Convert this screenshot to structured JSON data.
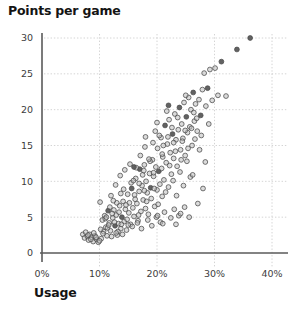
{
  "chart_data": {
    "type": "scatter",
    "title": "Points per game",
    "xlabel": "Usage",
    "ylabel": "Points per game",
    "xtick_labels": [
      "0%",
      "10%",
      "20%",
      "30%",
      "40%"
    ],
    "xtick_values": [
      0,
      10,
      20,
      30,
      40
    ],
    "ytick_labels": [
      "0",
      "5",
      "10",
      "15",
      "20",
      "25",
      "30"
    ],
    "ytick_values": [
      0,
      5,
      10,
      15,
      20,
      25,
      30
    ],
    "xlim": [
      0,
      42
    ],
    "ylim": [
      0,
      31.5
    ],
    "grid": true,
    "legend": false,
    "marker": {
      "shape": "circle",
      "radius_px": 2.4,
      "fill": "#bdbdbd",
      "stroke": "#4a4a4a",
      "fill_dark": "#5a5a5a",
      "fill_light": "#e3e3e3"
    },
    "axis_color": "#5a5a5a",
    "grid_color": "#c9c9c9",
    "series": [
      {
        "name": "players",
        "points": [
          [
            7.1,
            2.6,
            0
          ],
          [
            7.4,
            2.1,
            0
          ],
          [
            7.6,
            2.9,
            0
          ],
          [
            7.9,
            2.3,
            0
          ],
          [
            8.1,
            1.8,
            0
          ],
          [
            8.3,
            2.6,
            0
          ],
          [
            8.6,
            2.2,
            0
          ],
          [
            8.9,
            1.6,
            0
          ],
          [
            9.2,
            2.4,
            0
          ],
          [
            9.5,
            1.9,
            0
          ],
          [
            9.8,
            1.5,
            0
          ],
          [
            10.1,
            7.1,
            0
          ],
          [
            10.3,
            2.0,
            0
          ],
          [
            10.5,
            4.6,
            0
          ],
          [
            10.7,
            3.0,
            0
          ],
          [
            10.9,
            5.2,
            0
          ],
          [
            11.1,
            3.6,
            0
          ],
          [
            11.3,
            2.4,
            0
          ],
          [
            11.5,
            5.9,
            1
          ],
          [
            11.7,
            4.2,
            0
          ],
          [
            11.9,
            3.1,
            0
          ],
          [
            12.1,
            2.3,
            0
          ],
          [
            12.3,
            4.9,
            0
          ],
          [
            12.5,
            6.0,
            0
          ],
          [
            12.7,
            3.8,
            1
          ],
          [
            12.9,
            5.3,
            0
          ],
          [
            13.1,
            2.5,
            0
          ],
          [
            13.3,
            4.1,
            0
          ],
          [
            13.5,
            6.6,
            0
          ],
          [
            13.7,
            3.4,
            0
          ],
          [
            13.9,
            5.0,
            1
          ],
          [
            14.1,
            7.2,
            0
          ],
          [
            14.3,
            4.4,
            0
          ],
          [
            14.5,
            6.1,
            0
          ],
          [
            14.7,
            3.2,
            0
          ],
          [
            14.9,
            8.2,
            0
          ],
          [
            15.1,
            5.6,
            0
          ],
          [
            15.2,
            7.0,
            0
          ],
          [
            15.4,
            4.0,
            0
          ],
          [
            15.6,
            9.0,
            1
          ],
          [
            15.8,
            6.3,
            0
          ],
          [
            16.0,
            5.1,
            0
          ],
          [
            16.1,
            8.1,
            0
          ],
          [
            16.3,
            10.4,
            0
          ],
          [
            16.5,
            6.9,
            0
          ],
          [
            16.7,
            4.5,
            0
          ],
          [
            16.9,
            8.6,
            0
          ],
          [
            17.0,
            11.7,
            1
          ],
          [
            17.2,
            5.8,
            0
          ],
          [
            17.4,
            9.4,
            0
          ],
          [
            17.6,
            7.4,
            0
          ],
          [
            17.8,
            12.3,
            0
          ],
          [
            18.0,
            6.2,
            0
          ],
          [
            18.1,
            10.0,
            0
          ],
          [
            18.3,
            8.4,
            0
          ],
          [
            18.5,
            5.4,
            0
          ],
          [
            18.7,
            11.1,
            0
          ],
          [
            18.9,
            9.1,
            1
          ],
          [
            19.0,
            7.6,
            0
          ],
          [
            19.2,
            13.0,
            0
          ],
          [
            19.4,
            10.7,
            0
          ],
          [
            19.6,
            6.5,
            0
          ],
          [
            19.8,
            12.0,
            0
          ],
          [
            20.0,
            8.8,
            0
          ],
          [
            20.1,
            14.6,
            0
          ],
          [
            20.3,
            11.4,
            1
          ],
          [
            20.5,
            9.6,
            0
          ],
          [
            20.7,
            16.1,
            0
          ],
          [
            20.9,
            7.9,
            0
          ],
          [
            21.0,
            13.4,
            0
          ],
          [
            21.2,
            10.2,
            0
          ],
          [
            21.4,
            17.8,
            1
          ],
          [
            21.6,
            12.6,
            0
          ],
          [
            21.8,
            15.2,
            0
          ],
          [
            22.0,
            9.2,
            0
          ],
          [
            22.1,
            18.6,
            0
          ],
          [
            22.3,
            14.0,
            0
          ],
          [
            22.5,
            11.0,
            0
          ],
          [
            22.7,
            16.6,
            1
          ],
          [
            22.9,
            13.2,
            0
          ],
          [
            23.1,
            19.4,
            0
          ],
          [
            23.3,
            15.8,
            0
          ],
          [
            23.5,
            12.1,
            0
          ],
          [
            23.7,
            17.2,
            0
          ],
          [
            23.9,
            20.3,
            1
          ],
          [
            24.1,
            14.4,
            0
          ],
          [
            24.3,
            18.0,
            0
          ],
          [
            24.5,
            16.0,
            0
          ],
          [
            24.7,
            21.0,
            0
          ],
          [
            24.9,
            13.6,
            0
          ],
          [
            25.1,
            19.0,
            1
          ],
          [
            25.3,
            16.8,
            0
          ],
          [
            25.5,
            21.7,
            0
          ],
          [
            25.7,
            17.6,
            0
          ],
          [
            25.9,
            20.0,
            0
          ],
          [
            26.1,
            15.0,
            0
          ],
          [
            26.3,
            22.4,
            1
          ],
          [
            26.5,
            18.4,
            0
          ],
          [
            26.7,
            20.8,
            0
          ],
          [
            27.0,
            17.0,
            0
          ],
          [
            27.3,
            21.4,
            0
          ],
          [
            27.6,
            19.2,
            1
          ],
          [
            27.9,
            22.8,
            0
          ],
          [
            28.2,
            25.1,
            0
          ],
          [
            28.5,
            20.5,
            0
          ],
          [
            28.8,
            23.0,
            1
          ],
          [
            29.2,
            25.6,
            0
          ],
          [
            29.6,
            21.3,
            0
          ],
          [
            30.1,
            25.8,
            0
          ],
          [
            30.6,
            22.0,
            0
          ],
          [
            31.2,
            26.7,
            1
          ],
          [
            32.0,
            21.9,
            0
          ],
          [
            33.9,
            28.4,
            1
          ],
          [
            36.2,
            30.0,
            1
          ],
          [
            10.2,
            3.3,
            0
          ],
          [
            10.6,
            2.7,
            0
          ],
          [
            11.0,
            4.8,
            0
          ],
          [
            11.4,
            3.5,
            0
          ],
          [
            11.8,
            6.4,
            0
          ],
          [
            12.2,
            5.5,
            0
          ],
          [
            12.6,
            4.3,
            0
          ],
          [
            13.0,
            7.0,
            0
          ],
          [
            13.4,
            5.7,
            0
          ],
          [
            13.8,
            4.0,
            0
          ],
          [
            14.2,
            8.9,
            0
          ],
          [
            14.6,
            6.7,
            0
          ],
          [
            15.0,
            3.9,
            0
          ],
          [
            15.5,
            9.8,
            0
          ],
          [
            16.2,
            7.5,
            0
          ],
          [
            16.8,
            5.3,
            0
          ],
          [
            17.5,
            10.9,
            0
          ],
          [
            18.2,
            7.2,
            0
          ],
          [
            18.8,
            12.8,
            0
          ],
          [
            19.5,
            9.0,
            0
          ],
          [
            20.2,
            6.8,
            0
          ],
          [
            20.8,
            11.8,
            0
          ],
          [
            21.5,
            8.5,
            0
          ],
          [
            22.2,
            12.2,
            0
          ],
          [
            22.8,
            10.1,
            0
          ],
          [
            23.4,
            8.0,
            0
          ],
          [
            24.0,
            11.3,
            0
          ],
          [
            24.6,
            9.4,
            0
          ],
          [
            25.2,
            12.8,
            0
          ],
          [
            25.8,
            10.6,
            0
          ],
          [
            12.0,
            8.0,
            0
          ],
          [
            12.8,
            9.5,
            0
          ],
          [
            13.6,
            10.8,
            0
          ],
          [
            14.4,
            11.6,
            0
          ],
          [
            15.3,
            12.4,
            0
          ],
          [
            16.4,
            11.9,
            0
          ],
          [
            17.1,
            13.6,
            0
          ],
          [
            17.9,
            14.8,
            0
          ],
          [
            18.6,
            13.1,
            0
          ],
          [
            19.3,
            15.4,
            0
          ],
          [
            20.4,
            16.4,
            0
          ],
          [
            21.1,
            15.0,
            0
          ],
          [
            21.9,
            16.2,
            0
          ],
          [
            22.6,
            17.5,
            0
          ],
          [
            23.2,
            14.2,
            0
          ],
          [
            24.4,
            15.6,
            0
          ],
          [
            26.0,
            17.4,
            0
          ],
          [
            26.9,
            18.8,
            0
          ],
          [
            27.7,
            16.4,
            0
          ],
          [
            13.2,
            3.0,
            0
          ],
          [
            14.0,
            2.6,
            0
          ],
          [
            14.8,
            4.7,
            0
          ],
          [
            15.7,
            3.7,
            0
          ],
          [
            16.6,
            4.2,
            0
          ],
          [
            17.3,
            3.4,
            0
          ],
          [
            18.4,
            4.6,
            0
          ],
          [
            19.1,
            3.8,
            0
          ],
          [
            19.9,
            5.0,
            0
          ],
          [
            20.6,
            4.3,
            0
          ],
          [
            21.3,
            5.7,
            0
          ],
          [
            22.4,
            4.9,
            0
          ],
          [
            23.0,
            6.1,
            0
          ],
          [
            23.8,
            5.2,
            0
          ],
          [
            24.8,
            6.4,
            0
          ],
          [
            25.6,
            5.0,
            0
          ],
          [
            27.1,
            6.9,
            0
          ],
          [
            28.0,
            9.0,
            0
          ],
          [
            16.0,
            12.0,
            1
          ],
          [
            17.7,
            11.5,
            0
          ],
          [
            18.0,
            16.2,
            0
          ],
          [
            19.7,
            17.0,
            0
          ],
          [
            20.0,
            18.2,
            0
          ],
          [
            21.7,
            19.8,
            0
          ],
          [
            22.0,
            20.6,
            1
          ],
          [
            23.6,
            18.9,
            0
          ],
          [
            24.2,
            13.0,
            0
          ],
          [
            25.0,
            22.0,
            0
          ],
          [
            25.4,
            14.6,
            0
          ],
          [
            26.6,
            15.9,
            0
          ],
          [
            28.4,
            12.7,
            0
          ],
          [
            29.0,
            18.0,
            0
          ],
          [
            11.2,
            5.0,
            0
          ],
          [
            11.6,
            3.9,
            0
          ],
          [
            12.4,
            7.3,
            0
          ],
          [
            13.7,
            8.3,
            0
          ],
          [
            15.9,
            10.1,
            0
          ],
          [
            16.9,
            9.7,
            0
          ],
          [
            17.8,
            8.7,
            0
          ],
          [
            19.4,
            11.2,
            0
          ],
          [
            20.9,
            13.8,
            0
          ],
          [
            22.9,
            15.4,
            0
          ],
          [
            24.9,
            17.1,
            0
          ],
          [
            26.4,
            19.6,
            0
          ],
          [
            8.0,
            2.5,
            0
          ],
          [
            8.5,
            1.9,
            0
          ],
          [
            9.0,
            2.8,
            0
          ],
          [
            9.4,
            2.2,
            0
          ],
          [
            10.0,
            1.7,
            0
          ],
          [
            12.9,
            2.8,
            0
          ],
          [
            20.1,
            5.2,
            0
          ],
          [
            21.0,
            4.1,
            0
          ],
          [
            23.3,
            4.0,
            0
          ],
          [
            24.1,
            5.5,
            0
          ],
          [
            26.2,
            10.9,
            0
          ],
          [
            27.4,
            14.4,
            0
          ]
        ]
      }
    ]
  }
}
